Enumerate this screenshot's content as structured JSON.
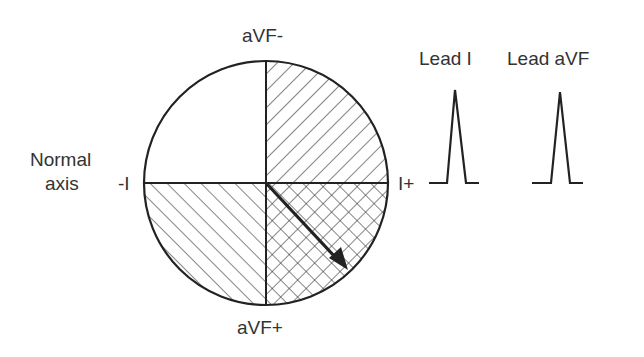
{
  "labels": {
    "axis_title_line1": "Normal",
    "axis_title_line2": "axis",
    "top": "aVF-",
    "bottom": "aVF+",
    "left": "-I",
    "right": "I+",
    "lead1": "Lead I",
    "leadavf": "Lead aVF"
  },
  "quadrants": [
    {
      "position": "upper-left",
      "pattern": "none"
    },
    {
      "position": "upper-right",
      "pattern": "forward-diagonal"
    },
    {
      "position": "lower-left",
      "pattern": "back-diagonal"
    },
    {
      "position": "lower-right",
      "pattern": "cross-hatch"
    }
  ],
  "axis_arrow": {
    "direction": "lower-right",
    "meaning": "normal axis"
  },
  "waveforms": [
    {
      "lead": "Lead I",
      "deflection": "positive"
    },
    {
      "lead": "Lead aVF",
      "deflection": "positive"
    }
  ],
  "colors": {
    "stroke": "#222222",
    "text": "#333333",
    "background": "#ffffff"
  }
}
